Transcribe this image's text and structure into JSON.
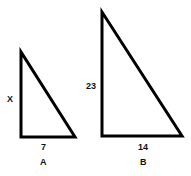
{
  "diagram": {
    "triangles": [
      {
        "name": "A",
        "label": "A",
        "vertical_side": "X",
        "base": "7",
        "points": [
          [
            21,
            52
          ],
          [
            21,
            137
          ],
          [
            75,
            137
          ]
        ]
      },
      {
        "name": "B",
        "label": "B",
        "vertical_side": "23",
        "base": "14",
        "points": [
          [
            102,
            12
          ],
          [
            102,
            136
          ],
          [
            182,
            136
          ]
        ]
      }
    ],
    "stroke_color": "#000000",
    "background": "#ffffff"
  }
}
